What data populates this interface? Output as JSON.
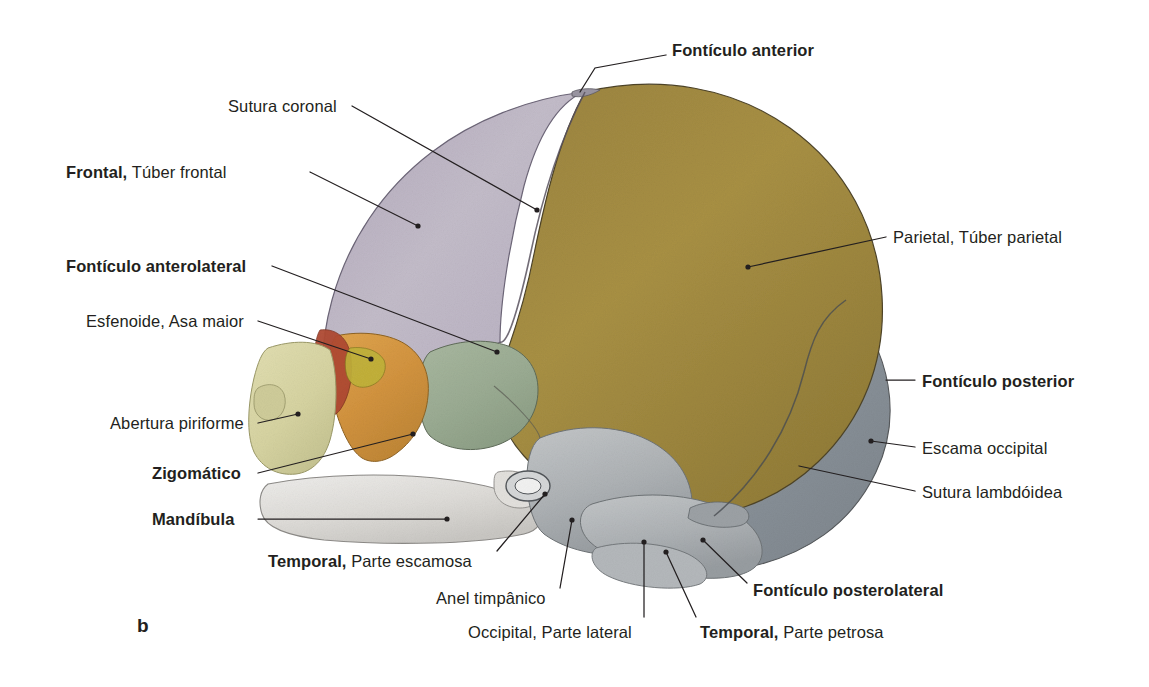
{
  "figure": {
    "panel_label": "b",
    "caption_type": "anatomical-illustration",
    "background_color": "#ffffff",
    "text_color": "#231f20"
  },
  "bones": [
    {
      "name": "frontal-bone",
      "label": "Frontal",
      "color": "#bbb2c4"
    },
    {
      "name": "parietal-bone",
      "label": "Parietal",
      "color": "#9c8540"
    },
    {
      "name": "occipital-squama",
      "label": "Escama occipital",
      "color": "#8f979e"
    },
    {
      "name": "sphenoid-greater-wing",
      "label": "Esfenoide, Asa maior",
      "color": "#d99a45"
    },
    {
      "name": "temporal-squamous-part",
      "label": "Temporal, Parte escamosa",
      "color": "#9fb096"
    },
    {
      "name": "maxilla-zygomatic",
      "label": "Zigomático",
      "color": "#ddd9a8"
    },
    {
      "name": "mandible",
      "label": "Mandíbula",
      "color": "#e9e9e7"
    },
    {
      "name": "petrous-part",
      "label": "Temporal, Parte petrosa",
      "color": "#b9bcbe"
    },
    {
      "name": "nasal-septum-accent",
      "label": "",
      "color": "#b04a32"
    }
  ],
  "labels": [
    {
      "id": "fonticulo-anterior",
      "bold_part": "Fontículo anterior",
      "regular_part": "",
      "x": 672,
      "y": 41,
      "align": "left",
      "leader": [
        [
          666,
          55
        ],
        [
          595,
          68
        ],
        [
          580,
          92
        ]
      ]
    },
    {
      "id": "sutura-coronal",
      "bold_part": "",
      "regular_part": "Sutura coronal",
      "x": 228,
      "y": 97,
      "align": "left",
      "leader": [
        [
          352,
          106
        ],
        [
          537,
          210
        ]
      ]
    },
    {
      "id": "frontal-tuber-frontal",
      "bold_part": "Frontal,",
      "regular_part": " Túber frontal",
      "x": 66,
      "y": 163,
      "align": "left",
      "leader": [
        [
          310,
          172
        ],
        [
          418,
          226
        ]
      ]
    },
    {
      "id": "parietal-tuber-parietal",
      "bold_part": "",
      "regular_part": "Parietal, Túber parietal",
      "x": 893,
      "y": 228,
      "align": "left",
      "leader": [
        [
          886,
          237
        ],
        [
          748,
          267
        ]
      ]
    },
    {
      "id": "fonticulo-anterolateral",
      "bold_part": "Fontículo anterolateral",
      "regular_part": "",
      "x": 66,
      "y": 257,
      "align": "left",
      "leader": [
        [
          272,
          266
        ],
        [
          497,
          352
        ]
      ]
    },
    {
      "id": "esfenoide-asa-maior",
      "bold_part": "",
      "regular_part": "Esfenoide, Asa maior",
      "x": 86,
      "y": 312,
      "align": "left",
      "leader": [
        [
          258,
          321
        ],
        [
          371,
          359
        ]
      ]
    },
    {
      "id": "fonticulo-posterior",
      "bold_part": "Fontículo posterior",
      "regular_part": "",
      "x": 922,
      "y": 372,
      "align": "left",
      "leader": [
        [
          915,
          380
        ],
        [
          886,
          380
        ]
      ]
    },
    {
      "id": "abertura-piriforme",
      "bold_part": "",
      "regular_part": "Abertura piriforme",
      "x": 110,
      "y": 414,
      "align": "left",
      "leader": [
        [
          258,
          423
        ],
        [
          298,
          414
        ]
      ]
    },
    {
      "id": "escama-occipital",
      "bold_part": "",
      "regular_part": "Escama occipital",
      "x": 922,
      "y": 439,
      "align": "left",
      "leader": [
        [
          915,
          447
        ],
        [
          871,
          441
        ]
      ]
    },
    {
      "id": "zigomatico",
      "bold_part": "Zigomático",
      "regular_part": "",
      "x": 152,
      "y": 464,
      "align": "left",
      "leader": [
        [
          258,
          473
        ],
        [
          413,
          434
        ]
      ]
    },
    {
      "id": "sutura-lambdoidea",
      "bold_part": "",
      "regular_part": "Sutura lambdóidea",
      "x": 922,
      "y": 483,
      "align": "left",
      "leader": [
        [
          915,
          491
        ],
        [
          799,
          466
        ]
      ]
    },
    {
      "id": "mandibula",
      "bold_part": "Mandíbula",
      "regular_part": "",
      "x": 152,
      "y": 510,
      "align": "left",
      "leader": [
        [
          258,
          519
        ],
        [
          447,
          519
        ]
      ]
    },
    {
      "id": "temporal-parte-escamosa",
      "bold_part": "Temporal,",
      "regular_part": " Parte escamosa",
      "x": 268,
      "y": 552,
      "align": "left",
      "leader": [
        [
          497,
          551
        ],
        [
          545,
          494
        ]
      ]
    },
    {
      "id": "fonticulo-posterolateral",
      "bold_part": "Fontículo posterolateral",
      "regular_part": "",
      "x": 753,
      "y": 581,
      "align": "left",
      "leader": [
        [
          747,
          583
        ],
        [
          703,
          540
        ]
      ]
    },
    {
      "id": "anel-timpanico",
      "bold_part": "",
      "regular_part": "Anel timpânico",
      "x": 436,
      "y": 589,
      "align": "left",
      "leader": [
        [
          560,
          588
        ],
        [
          572,
          520
        ]
      ]
    },
    {
      "id": "temporal-parte-petrosa",
      "bold_part": "Temporal,",
      "regular_part": " Parte petrosa",
      "x": 700,
      "y": 623,
      "align": "left",
      "leader": [
        [
          696,
          617
        ],
        [
          666,
          552
        ]
      ]
    },
    {
      "id": "occipital-parte-lateral",
      "bold_part": "",
      "regular_part": "Occipital, Parte lateral",
      "x": 468,
      "y": 623,
      "align": "left",
      "leader": [
        [
          644,
          617
        ],
        [
          644,
          542
        ]
      ]
    }
  ]
}
